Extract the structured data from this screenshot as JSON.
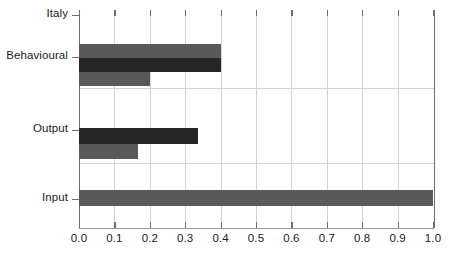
{
  "chart_data": {
    "type": "bar",
    "orientation": "horizontal",
    "title": "",
    "xlabel": "",
    "ylabel": "",
    "xlim": [
      0.0,
      1.0
    ],
    "grid": true,
    "legend": "none",
    "group_label": "Italy",
    "categories": [
      "Italy",
      "Behavioural",
      "Output",
      "Input"
    ],
    "xticks": [
      "0.0",
      "0.1",
      "0.2",
      "0.3",
      "0.4",
      "0.5",
      "0.6",
      "0.7",
      "0.8",
      "0.9",
      "1.0"
    ],
    "xtick_values": [
      0.0,
      0.1,
      0.2,
      0.3,
      0.4,
      0.5,
      0.6,
      0.7,
      0.8,
      0.9,
      1.0
    ],
    "groups": [
      {
        "label": "Italy",
        "bars": []
      },
      {
        "label": "Behavioural",
        "bars": [
          {
            "value": 0.4,
            "color": "#595959"
          },
          {
            "value": 0.4,
            "color": "#262626"
          },
          {
            "value": 0.2,
            "color": "#595959"
          }
        ]
      },
      {
        "label": "Output",
        "bars": [
          {
            "value": 0.335,
            "color": "#262626"
          },
          {
            "value": 0.167,
            "color": "#595959"
          }
        ]
      },
      {
        "label": "Input",
        "bars": [
          {
            "value": 1.0,
            "color": "#595959"
          }
        ]
      }
    ],
    "colors": {
      "bar_light": "#595959",
      "bar_dark": "#262626",
      "gridline": "#d2d2d2",
      "axis": "#6e6e6e",
      "text": "#1a1a1a",
      "background": "#ffffff"
    }
  },
  "geometry": {
    "plot_left": 79,
    "plot_right": 433,
    "plot_top": 10,
    "plot_bottom": 228,
    "ytick_positions": [
      15,
      57,
      130,
      199
    ],
    "hgrid_positions": [
      88,
      163
    ],
    "bar_layout": [
      {
        "group": "Behavioural",
        "bars": [
          {
            "top": 44,
            "height": 14
          },
          {
            "top": 58,
            "height": 14
          },
          {
            "top": 72,
            "height": 14
          }
        ]
      },
      {
        "group": "Output",
        "bars": [
          {
            "top": 128,
            "height": 16
          },
          {
            "top": 144,
            "height": 15
          }
        ]
      },
      {
        "group": "Input",
        "bars": [
          {
            "top": 190,
            "height": 16
          }
        ]
      }
    ]
  }
}
